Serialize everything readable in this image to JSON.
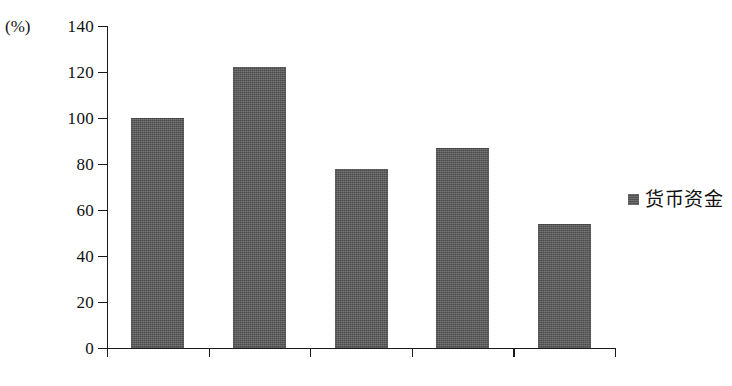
{
  "chart_data": {
    "type": "bar",
    "title": "",
    "xlabel": "年份",
    "ylabel": "(%)",
    "categories": [
      "2013",
      "2012",
      "2011",
      "2010",
      "2009"
    ],
    "values": [
      100,
      122,
      78,
      87,
      54
    ],
    "series": [
      {
        "name": "货币资金",
        "values": [
          100,
          122,
          78,
          87,
          54
        ]
      }
    ],
    "ylim": [
      0,
      140
    ],
    "ytick_step": 20,
    "yticks": [
      0,
      20,
      40,
      60,
      80,
      100,
      120,
      140
    ],
    "ytick_labels": [
      "0",
      "20",
      "40",
      "60",
      "80",
      "100",
      "120",
      "140"
    ],
    "grid": false,
    "legend_position": "right",
    "bar_color": "#5a5a5a",
    "axis_color": "#1a1a1a"
  },
  "axis": {
    "y_unit_label": "(%)",
    "x_unit_label": "（年份）"
  },
  "legend": {
    "entries": [
      {
        "label": "货币资金",
        "color": "#5a5a5a",
        "marker": "filled-square-marker"
      }
    ]
  }
}
